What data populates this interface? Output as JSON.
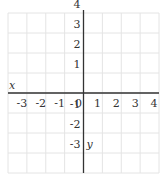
{
  "chart_data": {
    "type": "scatter",
    "title": "",
    "xlabel": "x",
    "ylabel": "y",
    "xlim": [
      -4,
      4
    ],
    "ylim": [
      -4,
      4
    ],
    "grid": true,
    "x_ticks": [
      -3,
      -2,
      -1,
      0,
      1,
      2,
      3,
      4
    ],
    "y_ticks": [
      4,
      3,
      2,
      1,
      -1,
      -2,
      -3
    ],
    "x_tick_labels": [
      "-3",
      "-2",
      "-1",
      "0",
      "1",
      "2",
      "3",
      "4"
    ],
    "y_tick_labels": [
      "4",
      "3",
      "2",
      "1",
      "-1",
      "-2",
      "-3"
    ],
    "series": []
  },
  "layout": {
    "left": 8,
    "right": 159,
    "top": 13,
    "bottom": 173,
    "colors": {
      "grid": "#e4e4e4",
      "axis": "#333333",
      "text": "#333333"
    }
  }
}
